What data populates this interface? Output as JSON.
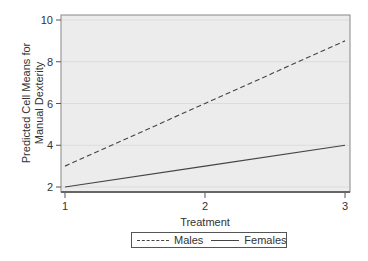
{
  "chart_data": {
    "type": "line",
    "title": "",
    "xlabel": "Treatment",
    "ylabel": "Predicted Cell Means for Manual Dexterity",
    "ylabel_lines": [
      "Predicted Cell Means for",
      "Manual Dexterity"
    ],
    "x": [
      1,
      2,
      3
    ],
    "x_ticks": [
      "1",
      "2",
      "3"
    ],
    "y_ticks": [
      "2",
      "4",
      "6",
      "8",
      "10"
    ],
    "ylim": [
      2,
      10
    ],
    "xlim": [
      1,
      3
    ],
    "grid": true,
    "legend_position": "bottom",
    "series": [
      {
        "name": "Males",
        "values": [
          3,
          6,
          9
        ],
        "style": "dashed",
        "color": "#444444"
      },
      {
        "name": "Females",
        "values": [
          2,
          3,
          4
        ],
        "style": "solid",
        "color": "#444444"
      }
    ]
  },
  "legend": {
    "males_label": "Males",
    "females_label": "Females"
  },
  "colors": {
    "plot_background": "#ececec",
    "frame": "#777777",
    "grid": "#dcdcdc",
    "line": "#444444"
  }
}
